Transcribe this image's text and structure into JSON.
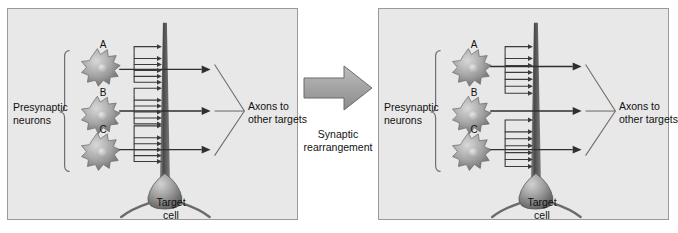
{
  "figure": {
    "background_color": "#ffffff",
    "panel_fill": "#e8e8e8",
    "panel_border": "#9a9a9a",
    "ink_color": "#3a3a3a",
    "text_color": "#111111"
  },
  "transition": {
    "label_line1": "Synaptic",
    "label_line2": "rearrangement",
    "arrow_name": "right-arrow",
    "arrow_fill": "#a8a8a8",
    "arrow_stroke": "#6b6b6b"
  },
  "panels": [
    {
      "id": "before",
      "presynaptic_label_line1": "Presynaptic",
      "presynaptic_label_line2": "neurons",
      "axons_label_line1": "Axons to",
      "axons_label_line2": "other targets",
      "target_label_line1": "Target",
      "target_label_line2": "cell",
      "neurons": [
        {
          "letter": "A",
          "synapse_count": 5
        },
        {
          "letter": "B",
          "synapse_count": 5
        },
        {
          "letter": "C",
          "synapse_count": 5
        }
      ]
    },
    {
      "id": "after",
      "presynaptic_label_line1": "Presynaptic",
      "presynaptic_label_line2": "neurons",
      "axons_label_line1": "Axons to",
      "axons_label_line2": "other targets",
      "target_label_line1": "Target",
      "target_label_line2": "cell",
      "neurons": [
        {
          "letter": "A",
          "synapse_count": 6
        },
        {
          "letter": "B",
          "synapse_count": 0
        },
        {
          "letter": "C",
          "synapse_count": 6
        }
      ]
    }
  ]
}
